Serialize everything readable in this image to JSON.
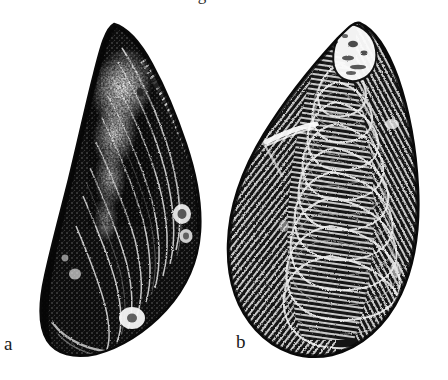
{
  "figure": {
    "type": "halftone-photographic-plate",
    "background_color": "#ffffff",
    "ink_color": "#111111",
    "top_cropped_glyph": "g",
    "panels": [
      {
        "id": "a",
        "label": "a",
        "subject": "mussel-shell-exterior-dark",
        "description": "Elongate wedge-shaped bivalve shell, dark periostracum, anterior umbo at upper left, broad rounded posterior margin at lower right, fine concentric growth lines with pale abraded highlight along the middle",
        "orientation": "umbo-upper-left",
        "bbox": {
          "x": 36,
          "y": 22,
          "width": 176,
          "height": 338
        },
        "tone": "very-dark"
      },
      {
        "id": "b",
        "label": "b",
        "subject": "mussel-shell-exterior-ribbed",
        "description": "Broadly ovate bivalve shell with prominent concentric growth rings, eroded pale umbo at top, rounded ventral margin, light diagonal scratch on the left flank",
        "orientation": "umbo-top",
        "bbox": {
          "x": 224,
          "y": 20,
          "width": 202,
          "height": 340
        },
        "tone": "mid-dark-striated"
      }
    ]
  }
}
